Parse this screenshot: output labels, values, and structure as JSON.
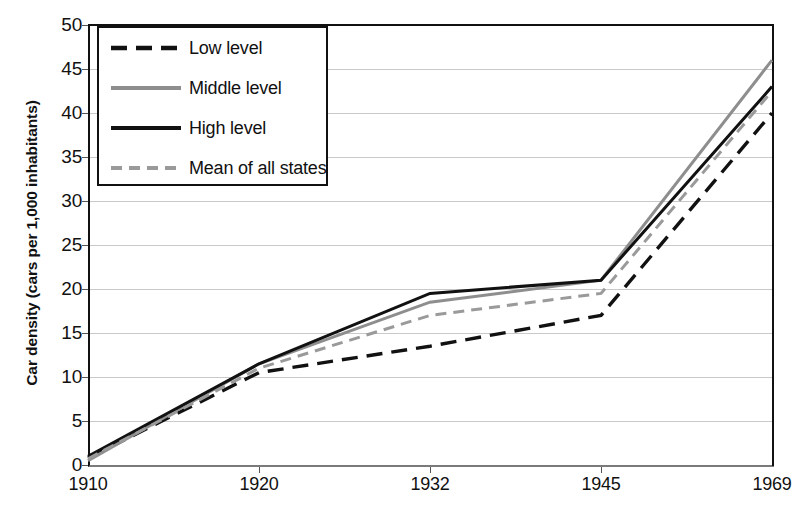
{
  "chart_data": {
    "type": "line",
    "title": "",
    "xlabel": "",
    "ylabel": "Car density (cars per 1,000 inhabitants)",
    "categories": [
      "1910",
      "1920",
      "1932",
      "1945",
      "1969"
    ],
    "ylim": [
      0,
      50
    ],
    "ytick_step": 5,
    "yticks": [
      "0",
      "5",
      "10",
      "15",
      "20",
      "25",
      "30",
      "35",
      "40",
      "45",
      "50"
    ],
    "grid": "horizontal",
    "legend_position": "top-left",
    "series": [
      {
        "name": "Low level",
        "values": [
          0.8,
          10.5,
          13.5,
          17.0,
          40.0
        ],
        "color": "#111111",
        "style": "dashed",
        "width": 3.4,
        "dash": "16,9"
      },
      {
        "name": "Middle level",
        "values": [
          0.5,
          11.5,
          18.5,
          21.0,
          46.0
        ],
        "color": "#8e8e8e",
        "style": "solid",
        "width": 3.0,
        "dash": ""
      },
      {
        "name": "High level",
        "values": [
          1.0,
          11.5,
          19.5,
          21.0,
          43.0
        ],
        "color": "#111111",
        "style": "solid",
        "width": 3.0,
        "dash": ""
      },
      {
        "name": "Mean of all states",
        "values": [
          0.7,
          11.0,
          17.0,
          19.5,
          42.5
        ],
        "color": "#9a9a9a",
        "style": "dashed",
        "width": 3.0,
        "dash": "11,7"
      }
    ]
  },
  "axes": {
    "y_label": "Car density (cars per 1,000 inhabitants)",
    "y_ticks": [
      "50",
      "45",
      "40",
      "35",
      "30",
      "25",
      "20",
      "15",
      "10",
      "5",
      "0"
    ],
    "x_ticks": [
      "1910",
      "1920",
      "1932",
      "1945",
      "1969"
    ]
  },
  "legend": {
    "items": [
      {
        "label": "Low level"
      },
      {
        "label": "Middle level"
      },
      {
        "label": "High level"
      },
      {
        "label": "Mean of all states"
      }
    ]
  }
}
